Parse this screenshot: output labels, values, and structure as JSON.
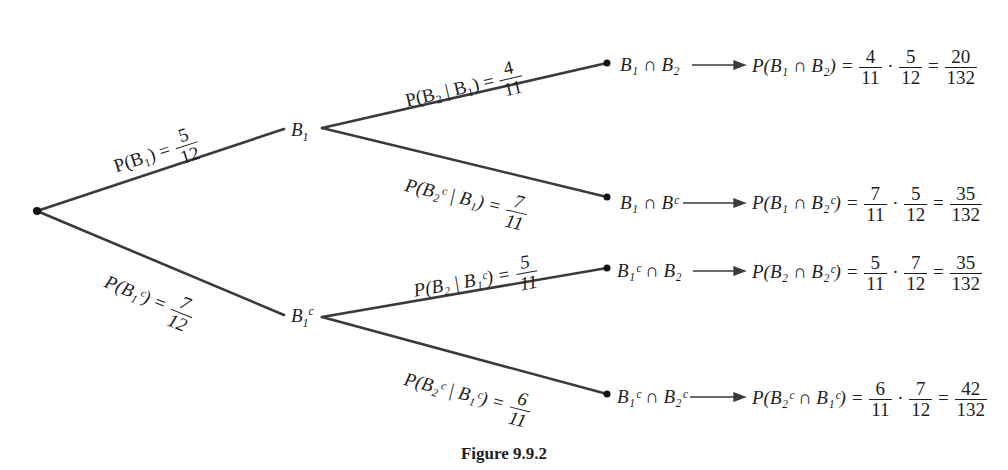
{
  "figure": {
    "caption": "Figure 9.9.2",
    "type": "probability tree diagram"
  },
  "nodes": {
    "root": "",
    "level1": [
      {
        "id": "B1",
        "label": "B",
        "sub": "1",
        "sup": ""
      },
      {
        "id": "B1c",
        "label": "B",
        "sub": "1",
        "sup": "c"
      }
    ]
  },
  "branches": {
    "root_to_B1": {
      "lhs": "P(B₁) =",
      "num": "5",
      "den": "12"
    },
    "root_to_B1c": {
      "lhs": "P(B₁ᶜ) =",
      "num": "7",
      "den": "12"
    },
    "B1_to_B2": {
      "lhs": "P(B₂ | B₁) =",
      "num": "4",
      "den": "11"
    },
    "B1_to_B2c": {
      "lhs": "P(B₂ᶜ | B₁) =",
      "num": "7",
      "den": "11"
    },
    "B1c_to_B2": {
      "lhs": "P(B₂ | B₁ᶜ) =",
      "num": "5",
      "den": "11"
    },
    "B1c_to_B2c": {
      "lhs": "P(B₂ᶜ | B₁ᶜ) =",
      "num": "6",
      "den": "11"
    }
  },
  "outcomes": [
    {
      "event": "B₁ ∩ B₂",
      "prob_lhs": "P(B₁ ∩ B₂) =",
      "f1n": "4",
      "f1d": "11",
      "f2n": "5",
      "f2d": "12",
      "rn": "20",
      "rd": "132"
    },
    {
      "event": "B₁ ∩ Bᶜ",
      "prob_lhs": "P(B₁ ∩ B₂ᶜ) =",
      "f1n": "7",
      "f1d": "11",
      "f2n": "5",
      "f2d": "12",
      "rn": "35",
      "rd": "132"
    },
    {
      "event": "B₁ᶜ ∩ B₂",
      "prob_lhs": "P(B₂ ∩ B₂ᶜ) =",
      "f1n": "5",
      "f1d": "11",
      "f2n": "7",
      "f2d": "12",
      "rn": "35",
      "rd": "132"
    },
    {
      "event": "B₁ᶜ ∩ B₂ᶜ",
      "prob_lhs": "P(B₂ᶜ ∩ B₁ᶜ) =",
      "f1n": "6",
      "f1d": "11",
      "f2n": "7",
      "f2d": "12",
      "rn": "42",
      "rd": "132"
    }
  ],
  "symbols": {
    "dot": "·",
    "eq": "="
  },
  "colors": {
    "line": "#3a3a3a",
    "text": "#1e1e1e",
    "background": "#ffffff"
  }
}
